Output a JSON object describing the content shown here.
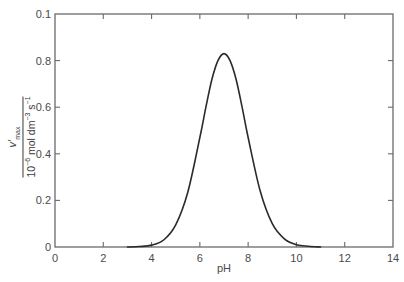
{
  "chart_data": {
    "type": "line",
    "title": "",
    "xlabel": "pH",
    "ylabel": "v'max / 10^-6 mol dm^-3 s^-1",
    "ylabel_parts": {
      "numerator_symbol": "v′",
      "numerator_sub": "max",
      "denominator_prefix": "10",
      "denominator_exp": "−6",
      "denominator_unit_1": " mol dm",
      "denominator_exp_2": "−3",
      "denominator_unit_2": " s",
      "denominator_exp_3": "−1"
    },
    "xlim": [
      0,
      14
    ],
    "ylim": [
      0,
      1.0
    ],
    "x_ticks": [
      0,
      2,
      4,
      6,
      8,
      10,
      12,
      14
    ],
    "x_tick_labels": [
      "0",
      "2",
      "4",
      "6",
      "8",
      "10",
      "12",
      "14"
    ],
    "y_ticks": [
      0,
      0.2,
      0.4,
      0.6,
      0.8,
      1.0
    ],
    "y_tick_labels": [
      "0",
      "0.2",
      "0.4",
      "0.6",
      "0.8",
      "0.1"
    ],
    "grid": false,
    "legend": null,
    "series": [
      {
        "name": "v'max vs pH",
        "color": "#2b2b2b",
        "x": [
          3.0,
          3.5,
          4.0,
          4.5,
          5.0,
          5.5,
          6.0,
          6.25,
          6.5,
          6.75,
          7.0,
          7.25,
          7.5,
          7.75,
          8.0,
          8.5,
          9.0,
          9.5,
          10.0,
          10.5,
          11.0
        ],
        "values": [
          0.0,
          0.002,
          0.008,
          0.03,
          0.095,
          0.235,
          0.47,
          0.6,
          0.72,
          0.8,
          0.83,
          0.8,
          0.72,
          0.6,
          0.47,
          0.24,
          0.1,
          0.035,
          0.01,
          0.003,
          0.0
        ]
      }
    ],
    "peak": {
      "x": 7.0,
      "y": 0.83
    }
  },
  "colors": {
    "axis": "#6a6a6a",
    "curve": "#2b2b2b",
    "text": "#4a4a4a",
    "background": "#ffffff"
  }
}
